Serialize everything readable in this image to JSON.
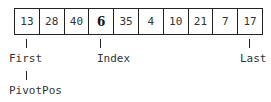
{
  "array": {
    "cells": [
      {
        "value": "13",
        "bold": false
      },
      {
        "value": "28",
        "bold": false
      },
      {
        "value": "40",
        "bold": false
      },
      {
        "value": "6",
        "bold": true
      },
      {
        "value": "35",
        "bold": false
      },
      {
        "value": "4",
        "bold": false
      },
      {
        "value": "10",
        "bold": false
      },
      {
        "value": "21",
        "bold": false
      },
      {
        "value": "7",
        "bold": false
      },
      {
        "value": "17",
        "bold": false
      }
    ]
  },
  "pointers": {
    "first": "First",
    "pivot_pos": "PivotPos",
    "index": "Index",
    "last": "Last"
  }
}
